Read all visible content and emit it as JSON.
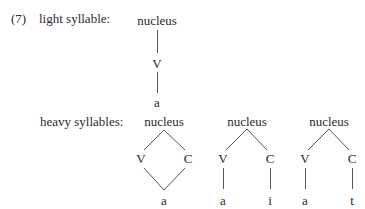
{
  "example": {
    "number": "(7)",
    "light": {
      "label": "light syllable:",
      "tree": {
        "root": "nucleus",
        "child": "V",
        "leaf": "a"
      }
    },
    "heavy": {
      "label": "heavy syllables:",
      "trees": [
        {
          "root": "nucleus",
          "left": "V",
          "right": "C",
          "leaves": [
            "a"
          ]
        },
        {
          "root": "nucleus",
          "left": "V",
          "right": "C",
          "leaves": [
            "a",
            "i"
          ]
        },
        {
          "root": "nucleus",
          "left": "V",
          "right": "C",
          "leaves": [
            "a",
            "t"
          ]
        }
      ]
    }
  }
}
